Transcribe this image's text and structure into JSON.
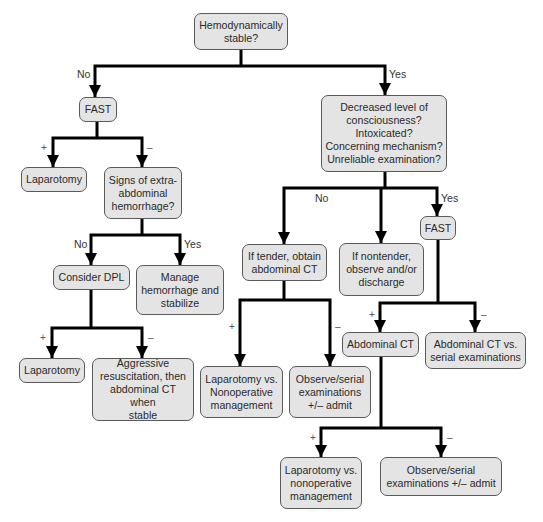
{
  "diagram": {
    "type": "flowchart",
    "nodes": {
      "root": "Hemodynamically\nstable?",
      "fast_unstable": "FAST",
      "laparotomy_1": "Laparotomy",
      "signs_extra": "Signs of extra-\nabdominal\nhemorrhage?",
      "consider_dpl": "Consider DPL",
      "manage_hemorrhage": "Manage\nhemorrhage and\nstabilize",
      "laparotomy_2": "Laparotomy",
      "aggressive": "Aggressive\nresuscitation, then\nabdominal CT when\nstable",
      "decreased_loc": "Decreased level of\nconsciousness?\nIntoxicated?\nConcerning mechanism?\nUnreliable examination?",
      "if_tender": "If tender, obtain\nabdominal CT",
      "if_nontender": "If nontender,\nobserve and/or\ndischarge",
      "fast_stable": "FAST",
      "lap_vs_nonop_1": "Laparotomy vs.\nNonoperative\nmanagement",
      "observe_1": "Observe/serial\nexaminations\n+/– admit",
      "abdominal_ct": "Abdominal CT",
      "ct_vs_serial": "Abdominal CT vs.\nserial examinations",
      "lap_vs_nonop_2": "Laparotomy vs.\nnonoperative\nmanagement",
      "observe_2": "Observe/serial\nexaminations +/– admit"
    },
    "edge_labels": {
      "no": "No",
      "yes": "Yes",
      "plus": "+",
      "minus": "–"
    },
    "colors": {
      "node_fill": "#e4e4e4",
      "node_border": "#5a5a5a",
      "connector": "#000000"
    }
  }
}
